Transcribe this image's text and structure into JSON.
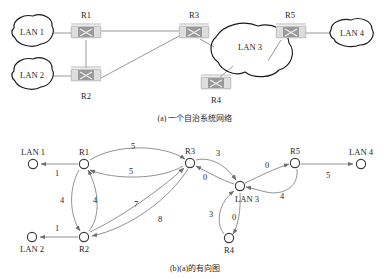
{
  "figure": {
    "title_a": "(a) 一个自治系统网络",
    "title_b": "(b)(a)的有向图"
  },
  "panel_a": {
    "name": "autonomous-system-network",
    "clouds": [
      {
        "id": "lan1",
        "label": "LAN 1",
        "cx": 30,
        "cy": 32
      },
      {
        "id": "lan2",
        "label": "LAN 2",
        "cx": 30,
        "cy": 75
      },
      {
        "id": "lan3",
        "label": "LAN 3",
        "cx": 243,
        "cy": 47
      },
      {
        "id": "lan4",
        "label": "LAN 4",
        "cx": 355,
        "cy": 33
      }
    ],
    "routers": [
      {
        "id": "r1",
        "label": "R1",
        "cx": 86,
        "cy": 32,
        "label_x": 86,
        "label_y": 16
      },
      {
        "id": "r2",
        "label": "R2",
        "cx": 86,
        "cy": 75,
        "label_x": 86,
        "label_y": 99
      },
      {
        "id": "r3",
        "label": "R3",
        "cx": 194,
        "cy": 32,
        "label_x": 194,
        "label_y": 16
      },
      {
        "id": "r4",
        "label": "R4",
        "cx": 216,
        "cy": 82,
        "label_x": 216,
        "label_y": 103
      },
      {
        "id": "r5",
        "label": "R5",
        "cx": 290,
        "cy": 32,
        "label_x": 290,
        "label_y": 16
      }
    ],
    "links": [
      {
        "from": "lan1",
        "to": "r1"
      },
      {
        "from": "r1",
        "to": "r3"
      },
      {
        "from": "r1",
        "to": "r2"
      },
      {
        "from": "lan2",
        "to": "r2"
      },
      {
        "from": "r2",
        "to": "r3"
      },
      {
        "from": "r3",
        "to": "lan3"
      },
      {
        "from": "lan3",
        "to": "r4"
      },
      {
        "from": "lan3",
        "to": "r5"
      },
      {
        "from": "r5",
        "to": "lan4"
      }
    ]
  },
  "panel_b": {
    "name": "directed-graph-of-a",
    "nodes": [
      {
        "id": "lan1",
        "label": "LAN 1",
        "x": 33,
        "y": 164,
        "label_x": 33,
        "label_y": 153
      },
      {
        "id": "r1",
        "label": "R1",
        "x": 84,
        "y": 164,
        "label_x": 84,
        "label_y": 153
      },
      {
        "id": "r3",
        "label": "R3",
        "x": 190,
        "y": 163,
        "label_x": 190,
        "label_y": 152
      },
      {
        "id": "r5",
        "label": "R5",
        "x": 295,
        "y": 163,
        "label_x": 295,
        "label_y": 152
      },
      {
        "id": "lan4",
        "label": "LAN 4",
        "x": 361,
        "y": 164,
        "label_x": 361,
        "label_y": 153
      },
      {
        "id": "lan3",
        "label": "LAN 3",
        "x": 240,
        "y": 186,
        "label_x": 245,
        "label_y": 201
      },
      {
        "id": "lan2",
        "label": "LAN 2",
        "x": 32,
        "y": 237,
        "label_x": 32,
        "label_y": 252
      },
      {
        "id": "r2",
        "label": "R2",
        "x": 84,
        "y": 237,
        "label_x": 84,
        "label_y": 252
      },
      {
        "id": "r4",
        "label": "R4",
        "x": 229,
        "y": 238,
        "label_x": 229,
        "label_y": 253
      }
    ],
    "edges": [
      {
        "from": "r1",
        "to": "lan1",
        "weight": "1",
        "wx": 57,
        "wy": 176
      },
      {
        "from": "r2",
        "to": "lan2",
        "weight": "1",
        "wx": 57,
        "wy": 230
      },
      {
        "from": "r1",
        "to": "r3",
        "weight": "5",
        "wx": 133,
        "wy": 148
      },
      {
        "from": "r3",
        "to": "r1",
        "weight": "5",
        "wx": 130,
        "wy": 173
      },
      {
        "from": "r1",
        "to": "r2",
        "weight": "4",
        "wx": 70,
        "wy": 201
      },
      {
        "from": "r2",
        "to": "r1",
        "weight": "4",
        "wx": 95,
        "wy": 201
      },
      {
        "from": "r2",
        "to": "r3",
        "weight": "7",
        "wx": 137,
        "wy": 205
      },
      {
        "from": "r3",
        "to": "r2",
        "weight": "8",
        "wx": 159,
        "wy": 219
      },
      {
        "from": "r3",
        "to": "lan3",
        "weight": "3",
        "wx": 216,
        "wy": 155
      },
      {
        "from": "lan3",
        "to": "r3",
        "weight": "0",
        "wx": 205,
        "wy": 179
      },
      {
        "from": "r4",
        "to": "lan3",
        "weight": "3",
        "wx": 215,
        "wy": 215
      },
      {
        "from": "lan3",
        "to": "r4",
        "weight": "0",
        "wx": 234,
        "wy": 218
      },
      {
        "from": "lan3",
        "to": "r5",
        "weight": "0",
        "wx": 266,
        "wy": 169
      },
      {
        "from": "r5",
        "to": "lan3",
        "weight": "4",
        "wx": 281,
        "wy": 196
      },
      {
        "from": "r5",
        "to": "lan4",
        "weight": "5",
        "wx": 328,
        "wy": 177
      }
    ]
  }
}
